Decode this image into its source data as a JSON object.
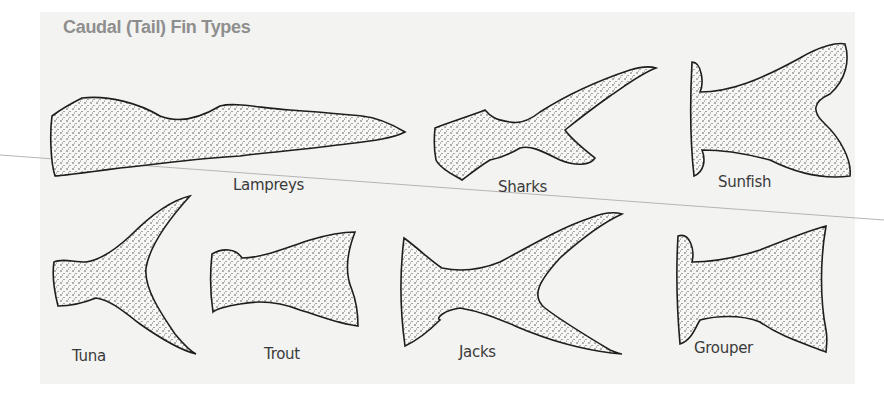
{
  "figure": {
    "title": "Caudal (Tail) Fin Types",
    "fins": [
      {
        "name": "Lampreys",
        "shape": "lamprey-fin"
      },
      {
        "name": "Sharks",
        "shape": "shark-fin"
      },
      {
        "name": "Sunfish",
        "shape": "sunfish-fin"
      },
      {
        "name": "Tuna",
        "shape": "tuna-fin"
      },
      {
        "name": "Trout",
        "shape": "trout-fin"
      },
      {
        "name": "Jacks",
        "shape": "jacks-fin"
      },
      {
        "name": "Grouper",
        "shape": "grouper-fin"
      }
    ]
  },
  "colors": {
    "panel": "#f3f3f2",
    "title": "#8e8e8e",
    "ink": "#1e1e1e",
    "label": "#3a3a3a"
  }
}
